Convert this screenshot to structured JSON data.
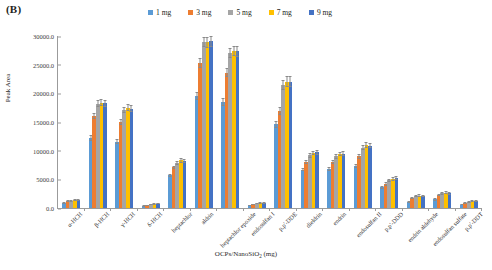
{
  "panel": {
    "label": "(B)"
  },
  "axis": {
    "y_title": "Peak Area",
    "x_title_main": "OCPs/NanoSiO",
    "x_title_sub": "2",
    "x_title_unit": " (mg)",
    "y_ticks": [
      "0.0",
      "5000.0",
      "10000.0",
      "15000.0",
      "20000.0",
      "25000.0",
      "30000.0"
    ]
  },
  "legend": {
    "items": [
      {
        "label": "1 mg",
        "color": "#5B9BD5"
      },
      {
        "label": "3 mg",
        "color": "#ED7D31"
      },
      {
        "label": "5 mg",
        "color": "#A5A5A5"
      },
      {
        "label": "7 mg",
        "color": "#FFC000"
      },
      {
        "label": "9 mg",
        "color": "#4472C4"
      }
    ]
  },
  "chart_data": {
    "type": "bar",
    "title": "(B)",
    "xlabel": "OCPs/NanoSiO2 (mg)",
    "ylabel": "Peak Area",
    "ylim": [
      0,
      30000
    ],
    "ytick_step": 5000,
    "grid": false,
    "legend_position": "top-center",
    "categories": [
      "α-HCH",
      "β-HCH",
      "γ-HCH",
      "δ-HCH",
      "heptachlor",
      "aldrin",
      "heptachlor epoxide",
      "endosulfan I",
      "p,p'-DDE",
      "dieldrin",
      "endrin",
      "endosulfan II",
      "p,p'-DDD",
      "endrin aldehyde",
      "endosulfan sulfate",
      "p,p'-DDT"
    ],
    "series": [
      {
        "name": "1 mg",
        "color": "#5B9BD5",
        "values": [
          900,
          12200,
          11600,
          350,
          5700,
          19500,
          18500,
          500,
          14600,
          6700,
          6800,
          7300,
          3600,
          1100,
          1500,
          600
        ],
        "errors": [
          150,
          450,
          400,
          80,
          250,
          700,
          650,
          90,
          600,
          300,
          300,
          350,
          250,
          150,
          200,
          120
        ]
      },
      {
        "name": "3 mg",
        "color": "#ED7D31",
        "values": [
          1150,
          16100,
          15000,
          480,
          7100,
          25300,
          23600,
          650,
          17000,
          8100,
          8000,
          9000,
          4200,
          1800,
          2300,
          900
        ],
        "errors": [
          180,
          500,
          500,
          90,
          300,
          800,
          750,
          100,
          700,
          350,
          350,
          400,
          280,
          180,
          230,
          140
        ]
      },
      {
        "name": "5 mg",
        "color": "#A5A5A5",
        "values": [
          1250,
          18200,
          17100,
          620,
          7900,
          29000,
          27100,
          780,
          21500,
          9200,
          9000,
          10500,
          4800,
          2050,
          2550,
          1100
        ],
        "errors": [
          200,
          600,
          550,
          100,
          350,
          900,
          850,
          120,
          900,
          400,
          380,
          450,
          300,
          200,
          250,
          160
        ]
      },
      {
        "name": "7 mg",
        "color": "#FFC000",
        "values": [
          1350,
          18400,
          17500,
          700,
          8300,
          28900,
          27400,
          850,
          22000,
          9600,
          9400,
          11000,
          5100,
          2150,
          2700,
          1250
        ],
        "errors": [
          200,
          600,
          600,
          110,
          380,
          950,
          900,
          130,
          950,
          420,
          400,
          470,
          320,
          210,
          260,
          170
        ]
      },
      {
        "name": "9 mg",
        "color": "#4472C4",
        "values": [
          1400,
          18300,
          17300,
          760,
          8200,
          29100,
          27300,
          880,
          22000,
          9700,
          9500,
          10900,
          5200,
          2100,
          2600,
          1200
        ],
        "errors": [
          210,
          620,
          600,
          110,
          380,
          950,
          900,
          130,
          950,
          430,
          410,
          470,
          330,
          210,
          260,
          170
        ]
      }
    ]
  }
}
